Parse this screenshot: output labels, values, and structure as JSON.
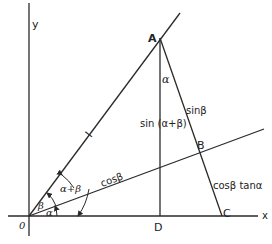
{
  "diagram": {
    "axes": {
      "x_label": "x",
      "y_label": "y",
      "origin_label": "0"
    },
    "points": {
      "A": "A",
      "B": "B",
      "C": "C",
      "D": "D"
    },
    "segment_labels": {
      "OA": "l",
      "OB": "cosβ",
      "AB": "sinβ",
      "AD": "sin (α+β)",
      "BC": "cosβ tanα"
    },
    "angle_labels": {
      "alpha_at_O": "α",
      "beta_at_O": "β",
      "alpha_plus_beta": "α+β",
      "alpha_at_A": "α"
    },
    "colors": {
      "stroke": "#2a2a2a",
      "background": "#ffffff"
    }
  }
}
